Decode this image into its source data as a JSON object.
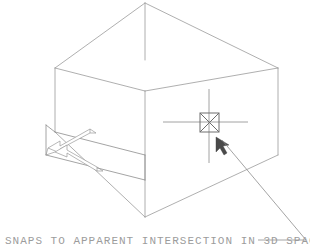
{
  "drawing": {
    "title": "Apparent intersection 3D snap illustration",
    "caption": "SNAPS TO APPARENT INTERSECTION IN 3D SPACE",
    "colors": {
      "background": "#ffffff",
      "geometry_line": "#9a9a9a",
      "snap_marker": "#6e6e6e",
      "crosshair": "#8a8a8a",
      "cursor": "#4a4a4a",
      "caption_text": "#9c9c9c"
    },
    "objects": {
      "box_label": "wireframe box",
      "snap_marker_label": "apparent intersection snap marker",
      "crosshair_label": "crosshair cursor",
      "cursor_label": "pick arrow cursor",
      "leader_label": "leader line to snap point",
      "dimension_label": "isometric dimension arrows"
    },
    "geometry": {
      "box_edges": [
        "M145,3 L55,68",
        "M145,3 L278,68",
        "M55,68 L145,91",
        "M278,68 L145,91",
        "M145,3 L145,91",
        "M55,68 L55,132",
        "M278,68 L278,155",
        "M145,91 L145,217",
        "M55,132 L145,217",
        "M145,217 L278,155",
        "M55,132 L46,155",
        "M46,155 L145,180",
        "M145,180 L145,217",
        "M46,155 L46,125"
      ],
      "crosshair_lines": [
        "M209,89 L209,163",
        "M163,122 L248,122"
      ],
      "snap_marker_rect": {
        "x": 200,
        "y": 113,
        "w": 19,
        "h": 19
      },
      "snap_marker_cross": [
        "M200,113 L219,132",
        "M219,113 L200,132"
      ],
      "leader_path": "M306,240 L215,133",
      "cursor_arrow_points": "218,139 218,153 222,149 226,156 229,154 225,147 231,147"
    },
    "dimension_arrows": {
      "upper_arrow": "M86,128 L56,147 L62,149 L59,151 L89,132 L83,130 Z",
      "lower_arrow": "M95,167 L65,148 L71,146 L68,144 L98,163 L92,165 Z"
    },
    "caption_position": {
      "x": 5,
      "y": 244
    },
    "leader_tail": "M255,240 L306,240"
  }
}
